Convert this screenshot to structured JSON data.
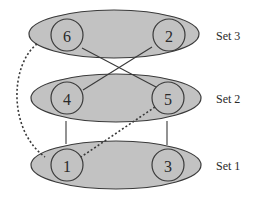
{
  "diagram": {
    "sets": [
      {
        "id": "set3",
        "label": "Set 3",
        "cx": 114,
        "cy": 34,
        "rx": 85,
        "ry": 24,
        "label_x": 216,
        "label_y": 36
      },
      {
        "id": "set2",
        "label": "Set 2",
        "cx": 116,
        "cy": 98,
        "rx": 85,
        "ry": 24,
        "label_x": 216,
        "label_y": 99
      },
      {
        "id": "set1",
        "label": "Set 1",
        "cx": 116,
        "cy": 165,
        "rx": 85,
        "ry": 24,
        "label_x": 216,
        "label_y": 166
      }
    ],
    "nodes": [
      {
        "id": "6",
        "label": "6",
        "set": "Set 3",
        "cx": 67,
        "cy": 35,
        "r": 16
      },
      {
        "id": "2",
        "label": "2",
        "set": "Set 3",
        "cx": 169,
        "cy": 35,
        "r": 16
      },
      {
        "id": "4",
        "label": "4",
        "set": "Set 2",
        "cx": 67,
        "cy": 98,
        "r": 16
      },
      {
        "id": "5",
        "label": "5",
        "set": "Set 2",
        "cx": 168,
        "cy": 98,
        "r": 16
      },
      {
        "id": "1",
        "label": "1",
        "set": "Set 1",
        "cx": 67,
        "cy": 165,
        "r": 16
      },
      {
        "id": "3",
        "label": "3",
        "set": "Set 1",
        "cx": 168,
        "cy": 165,
        "r": 16
      }
    ],
    "edges": [
      {
        "from": "6",
        "to": "5",
        "style": "solid"
      },
      {
        "from": "2",
        "to": "4",
        "style": "solid"
      },
      {
        "from": "4",
        "to": "1",
        "style": "solid"
      },
      {
        "from": "5",
        "to": "3",
        "style": "solid"
      },
      {
        "from": "5",
        "to": "1",
        "style": "dashed"
      },
      {
        "from": "6",
        "to": "1",
        "style": "dashed-curve"
      }
    ]
  }
}
